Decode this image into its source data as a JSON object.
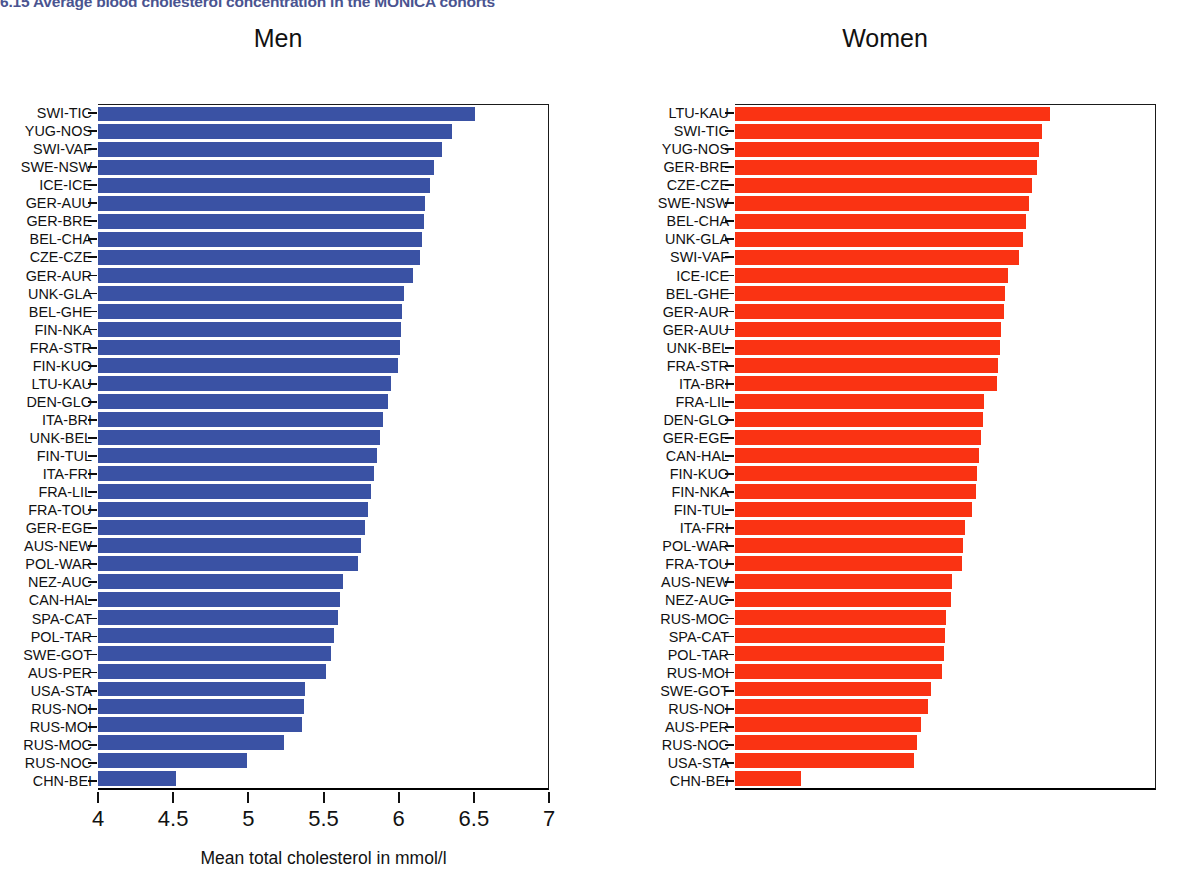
{
  "figure": {
    "title": "6.15  Average blood cholesterol concentration in the MONICA cohorts",
    "title_color": "#4a5490"
  },
  "chart_data": {
    "type": "bar",
    "title": "6.15  Average blood cholesterol concentration in the MONICA cohorts",
    "orientation": "horizontal",
    "xlabel": "Mean total cholesterol in mmol/l",
    "ylabel": "",
    "xlim": [
      4,
      7
    ],
    "xticks": [
      4,
      4.5,
      5,
      5.5,
      6,
      6.5,
      7
    ],
    "xtick_labels": [
      "4",
      "4.5",
      "5",
      "5.5",
      "6",
      "6.5",
      "7"
    ],
    "grid": false,
    "legend": "none",
    "panels": [
      {
        "name": "Men",
        "color": "#3a52a4",
        "categories": [
          "SWI-TIC",
          "YUG-NOS",
          "SWI-VAF",
          "SWE-NSW",
          "ICE-ICE",
          "GER-AUU",
          "GER-BRE",
          "BEL-CHA",
          "CZE-CZE",
          "GER-AUR",
          "UNK-GLA",
          "BEL-GHE",
          "FIN-NKA",
          "FRA-STR",
          "FIN-KUO",
          "LTU-KAU",
          "DEN-GLO",
          "ITA-BRI",
          "UNK-BEL",
          "FIN-TUL",
          "ITA-FRI",
          "FRA-LIL",
          "FRA-TOU",
          "GER-EGE",
          "AUS-NEW",
          "POL-WAR",
          "NEZ-AUC",
          "CAN-HAL",
          "SPA-CAT",
          "POL-TAR",
          "SWE-GOT",
          "AUS-PER",
          "USA-STA",
          "RUS-NOI",
          "RUS-MOI",
          "RUS-MOC",
          "RUS-NOC",
          "CHN-BEI"
        ],
        "values": [
          6.51,
          6.36,
          6.29,
          6.24,
          6.21,
          6.18,
          6.17,
          6.16,
          6.15,
          6.1,
          6.04,
          6.03,
          6.02,
          6.01,
          6.0,
          5.95,
          5.93,
          5.9,
          5.88,
          5.86,
          5.84,
          5.82,
          5.8,
          5.78,
          5.75,
          5.73,
          5.63,
          5.61,
          5.6,
          5.57,
          5.55,
          5.52,
          5.38,
          5.37,
          5.36,
          5.24,
          4.99,
          4.52
        ]
      },
      {
        "name": "Women",
        "color": "#fa3313",
        "categories": [
          "LTU-KAU",
          "SWI-TIC",
          "YUG-NOS",
          "GER-BRE",
          "CZE-CZE",
          "SWE-NSW",
          "BEL-CHA",
          "UNK-GLA",
          "SWI-VAF",
          "ICE-ICE",
          "BEL-GHE",
          "GER-AUR",
          "GER-AUU",
          "UNK-BEL",
          "FRA-STR",
          "ITA-BRI",
          "FRA-LIL",
          "DEN-GLO",
          "GER-EGE",
          "CAN-HAL",
          "FIN-KUO",
          "FIN-NKA",
          "FIN-TUL",
          "ITA-FRI",
          "POL-WAR",
          "FRA-TOU",
          "AUS-NEW",
          "NEZ-AUC",
          "RUS-MOC",
          "SPA-CAT",
          "POL-TAR",
          "RUS-MOI",
          "SWE-GOT",
          "RUS-NOI",
          "AUS-PER",
          "RUS-NOC",
          "USA-STA",
          "CHN-BEI"
        ],
        "values": [
          6.25,
          6.19,
          6.17,
          6.16,
          6.12,
          6.1,
          6.08,
          6.06,
          6.03,
          5.95,
          5.93,
          5.92,
          5.9,
          5.89,
          5.88,
          5.87,
          5.78,
          5.77,
          5.76,
          5.74,
          5.73,
          5.72,
          5.69,
          5.64,
          5.63,
          5.62,
          5.55,
          5.54,
          5.51,
          5.5,
          5.49,
          5.48,
          5.4,
          5.38,
          5.33,
          5.3,
          5.28,
          4.47
        ]
      }
    ]
  },
  "axes": {
    "men": {
      "x_title": "Mean total cholesterol in mmol/l"
    },
    "women": {
      "x_title": "Mean total cholesterol in mmol/l"
    }
  }
}
